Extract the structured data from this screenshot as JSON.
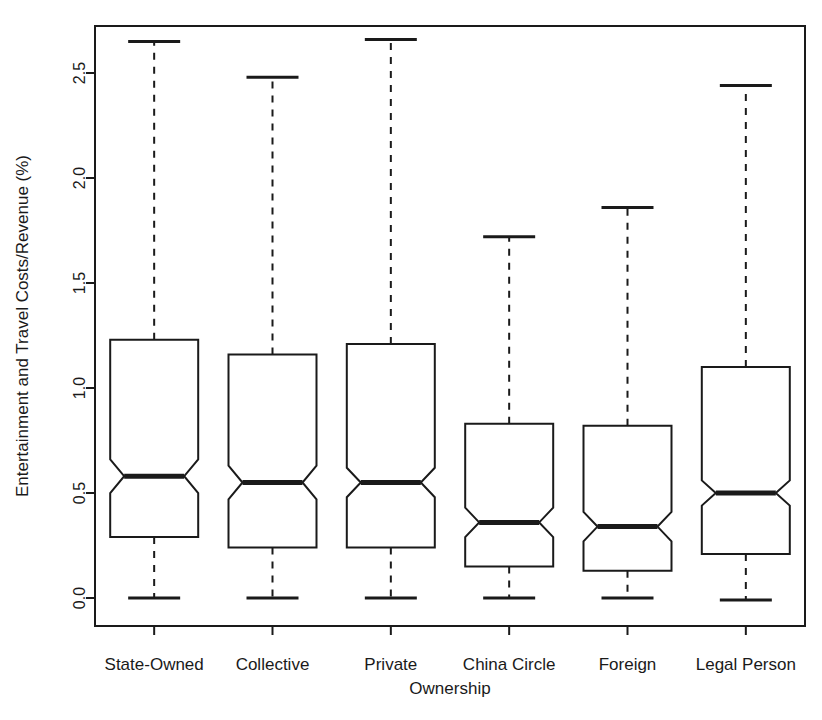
{
  "chart_data": {
    "type": "box",
    "title": "",
    "xlabel": "Ownership",
    "ylabel": "Entertainment and Travel Costs/Revenue (%)",
    "categories": [
      "State-Owned",
      "Collective",
      "Private",
      "China Circle",
      "Foreign",
      "Legal Person"
    ],
    "ytick_labels": [
      "0.0",
      "0.5",
      "1.0",
      "1.5",
      "2.0",
      "2.5"
    ],
    "ytick_values": [
      0.0,
      0.5,
      1.0,
      1.5,
      2.0,
      2.5
    ],
    "ylim": [
      -0.08,
      2.77
    ],
    "grid": false,
    "legend": "none",
    "notched": true,
    "boxes": [
      {
        "category": "State-Owned",
        "whisker_low": 0.0,
        "q1": 0.29,
        "median": 0.58,
        "q3": 1.23,
        "whisker_high": 2.65,
        "notch_low": 0.5,
        "notch_high": 0.66
      },
      {
        "category": "Collective",
        "whisker_low": 0.0,
        "q1": 0.24,
        "median": 0.55,
        "q3": 1.16,
        "whisker_high": 2.48,
        "notch_low": 0.47,
        "notch_high": 0.63
      },
      {
        "category": "Private",
        "whisker_low": 0.0,
        "q1": 0.24,
        "median": 0.55,
        "q3": 1.21,
        "whisker_high": 2.66,
        "notch_low": 0.48,
        "notch_high": 0.62
      },
      {
        "category": "China Circle",
        "whisker_low": 0.0,
        "q1": 0.15,
        "median": 0.36,
        "q3": 0.83,
        "whisker_high": 1.72,
        "notch_low": 0.29,
        "notch_high": 0.43
      },
      {
        "category": "Foreign",
        "whisker_low": 0.0,
        "q1": 0.13,
        "median": 0.34,
        "q3": 0.82,
        "whisker_high": 1.86,
        "notch_low": 0.27,
        "notch_high": 0.41
      },
      {
        "category": "Legal Person",
        "whisker_low": -0.01,
        "q1": 0.21,
        "median": 0.5,
        "q3": 1.1,
        "whisker_high": 2.44,
        "notch_low": 0.44,
        "notch_high": 0.56
      }
    ]
  },
  "plot_geometry": {
    "left": 95,
    "right": 805,
    "top": 26,
    "bottom": 626,
    "y_zero_px": 598,
    "px_per_unit": 210,
    "box_half_width": 44,
    "notch_half_width": 30,
    "cap_half_width": 26
  }
}
